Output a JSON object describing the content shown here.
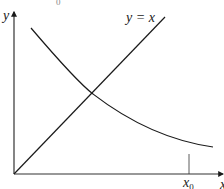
{
  "diagram": {
    "axes": {
      "y_label": "y",
      "x_label": "x"
    },
    "line": {
      "label": "y = x",
      "color": "#1a1a1a"
    },
    "curve": {
      "description": "decreasing convex curve",
      "color": "#1a1a1a"
    },
    "marker": {
      "label_main": "x",
      "label_sub": "0"
    },
    "top_fragment": "0"
  }
}
